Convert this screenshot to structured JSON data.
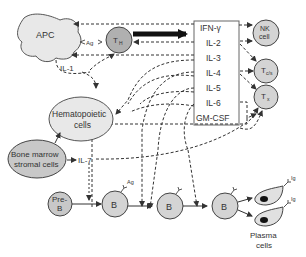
{
  "diagram": {
    "nodes": {
      "apc": "APC",
      "th": "T",
      "th_sub": "H",
      "ag_apc": "Ag",
      "il1": "IL-1",
      "hematopoietic_line1": "Hematopoietic",
      "hematopoietic_line2": "cells",
      "bone_line1": "Bone marrow",
      "bone_line2": "stromal cells",
      "il7": "IL-7",
      "preb_line1": "Pre-",
      "preb_line2": "B",
      "b1": "B",
      "b1_ag": "Ag",
      "b2": "B",
      "b3": "B",
      "nk_line1": "NK",
      "nk_line2": "cell",
      "tcs": "T",
      "tcs_sub": "c/s",
      "tx": "T",
      "tx_sub": "x",
      "ig1": "Ig",
      "ig2": "Ig",
      "plasma_line1": "Plasma",
      "plasma_line2": "cells"
    },
    "cytokines": [
      "IFN-γ",
      "IL-2",
      "IL-3",
      "IL-4",
      "IL-5",
      "IL-6",
      "GM-CSF"
    ],
    "colors": {
      "cell_fill": "#d4d4d4",
      "apc_fill": "#e8e8e8",
      "stroke": "#444444",
      "arrow_bold": "#111111"
    }
  }
}
